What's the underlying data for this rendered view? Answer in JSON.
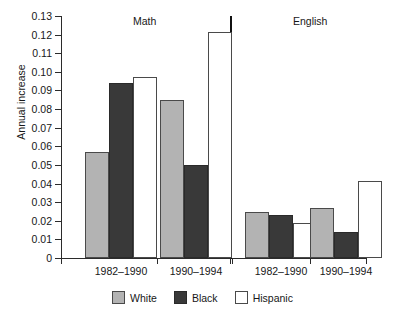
{
  "chart_data": {
    "type": "bar",
    "title": "",
    "xlabel": "",
    "ylabel": "Annual increase",
    "ylim": [
      0,
      0.13
    ],
    "ytick_step": 0.01,
    "grid": false,
    "legend_position": "bottom-center",
    "panels": [
      {
        "label": "Math",
        "categories": [
          "1982–1990",
          "1990–1994"
        ]
      },
      {
        "label": "English",
        "categories": [
          "1982–1990",
          "1990–1994"
        ]
      }
    ],
    "categories": [
      "1982–1990",
      "1990–1994",
      "1982–1990",
      "1990–1994"
    ],
    "ytick_labels": [
      "0.13",
      "0.12",
      "0.11",
      "0.10",
      "0.09",
      "0.08",
      "0.07",
      "0.06",
      "0.05",
      "0.04",
      "0.03",
      "0.02",
      "0.01",
      "0"
    ],
    "series": [
      {
        "name": "White",
        "color": "#b3b3b3",
        "values": [
          0.057,
          0.085,
          0.0245,
          0.027
        ]
      },
      {
        "name": "Black",
        "color": "#393939",
        "values": [
          0.094,
          0.05,
          0.023,
          0.014
        ]
      },
      {
        "name": "Hispanic",
        "color": "#ffffff",
        "values": [
          0.097,
          0.1215,
          0.0188,
          0.0412
        ]
      }
    ]
  },
  "axis": {
    "y_title": "Annual increase",
    "y_max_label": "0.13",
    "y_min_label": "0"
  },
  "panels": {
    "math_label": "Math",
    "english_label": "English"
  },
  "legend": {
    "items": [
      {
        "label": "White"
      },
      {
        "label": "Black"
      },
      {
        "label": "Hispanic"
      }
    ]
  }
}
